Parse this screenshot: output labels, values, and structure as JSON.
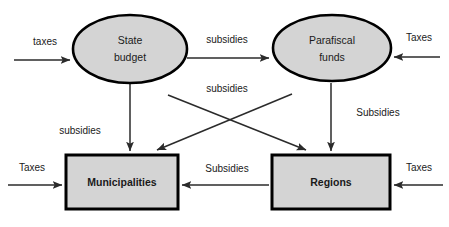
{
  "diagram": {
    "colors": {
      "node_fill": "#d4d4d4",
      "node_stroke": "#000000",
      "arrow": "#2b2b2b",
      "background": "#ffffff",
      "text": "#1a1a1a"
    },
    "nodes": [
      {
        "id": "state_budget",
        "label_line1": "State",
        "label_line2": "budget",
        "shape": "ellipse",
        "cx": 130,
        "cy": 49,
        "rx": 57,
        "ry": 34,
        "bold": false
      },
      {
        "id": "parafiscal_funds",
        "label_line1": "Parafiscal",
        "label_line2": "funds",
        "shape": "ellipse",
        "cx": 332,
        "cy": 48,
        "rx": 59,
        "ry": 33,
        "bold": false
      },
      {
        "id": "municipalities",
        "label_line1": "Municipalities",
        "label_line2": "",
        "shape": "rect",
        "x": 66,
        "y": 155,
        "w": 112,
        "h": 54,
        "bold": true
      },
      {
        "id": "regions",
        "label_line1": "Regions",
        "label_line2": "",
        "shape": "rect",
        "x": 272,
        "y": 155,
        "w": 118,
        "h": 54,
        "bold": true
      }
    ],
    "edges": [
      {
        "id": "taxes-to-state-budget",
        "label": "taxes",
        "from": "external-left",
        "to": "state_budget",
        "label_x": 45,
        "label_y": 42
      },
      {
        "id": "taxes-to-parafiscal-funds",
        "label": "Taxes",
        "from": "external-right",
        "to": "parafiscal_funds",
        "label_x": 419,
        "label_y": 38
      },
      {
        "id": "state-budget-to-parafiscal-funds",
        "label": "subsidies",
        "from": "state_budget",
        "to": "parafiscal_funds",
        "label_x": 227,
        "label_y": 40
      },
      {
        "id": "crossing-subsidies",
        "label": "subsidies",
        "from": "state_budget",
        "to": "regions",
        "label_x": 227,
        "label_y": 89
      },
      {
        "id": "state-budget-to-municipalities",
        "label": "subsidies",
        "from": "state_budget",
        "to": "municipalities",
        "label_x": 80,
        "label_y": 131
      },
      {
        "id": "parafiscal-funds-to-regions",
        "label": "Subsidies",
        "from": "parafiscal_funds",
        "to": "regions",
        "label_x": 378,
        "label_y": 113
      },
      {
        "id": "parafiscal-funds-to-municipalities",
        "label": "",
        "from": "parafiscal_funds",
        "to": "municipalities",
        "label_x": 0,
        "label_y": 0
      },
      {
        "id": "regions-to-municipalities",
        "label": "Subsidies",
        "from": "regions",
        "to": "municipalities",
        "label_x": 227,
        "label_y": 169
      },
      {
        "id": "taxes-to-municipalities",
        "label": "Taxes",
        "from": "external-left",
        "to": "municipalities",
        "label_x": 32,
        "label_y": 168
      },
      {
        "id": "taxes-to-regions",
        "label": "Taxes",
        "from": "external-right",
        "to": "regions",
        "label_x": 419,
        "label_y": 168
      }
    ]
  }
}
